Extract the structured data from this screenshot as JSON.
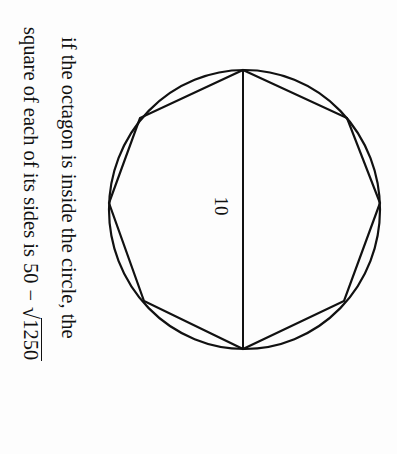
{
  "figure": {
    "type": "octagon-inscribed-in-circle",
    "orientation": "rotated 90 degrees clockwise",
    "diameter_label": "10",
    "circle": {
      "cx": 244.5,
      "cy": 209.5,
      "rx": 135.5,
      "ry": 139.5
    },
    "octagon_vertices": [
      [
        243,
        70
      ],
      [
        347,
        118
      ],
      [
        380,
        203
      ],
      [
        344,
        301
      ],
      [
        243,
        349
      ],
      [
        144,
        301
      ],
      [
        109,
        203
      ],
      [
        140,
        118
      ]
    ],
    "diameter": {
      "x1": 243,
      "y1": 70,
      "x2": 243,
      "y2": 349
    },
    "stroke_color": "#111111",
    "background_color": "#fdfdfd"
  },
  "text": {
    "line1": "if the octagon is inside the circle, the",
    "line2_prefix": "square of each of its sides is",
    "expr_left": "50",
    "expr_op": "−",
    "expr_sqrt_sign": "√",
    "expr_radicand": "1250"
  }
}
